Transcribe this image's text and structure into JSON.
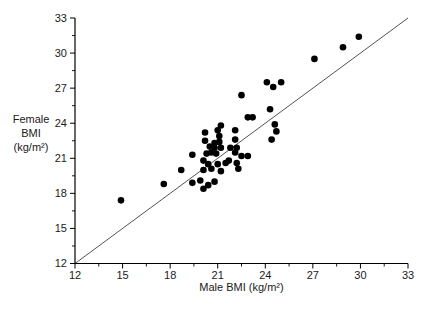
{
  "chart_data": {
    "type": "scatter",
    "title": "",
    "xlabel": "Male BMI (kg/m²)",
    "ylabel_lines": [
      "Female",
      "BMI",
      "(kg/m²)"
    ],
    "xlim": [
      12,
      33
    ],
    "ylim": [
      12,
      33
    ],
    "x_ticks": [
      12,
      15,
      18,
      21,
      24,
      27,
      30,
      33
    ],
    "y_ticks": [
      12,
      15,
      18,
      21,
      24,
      27,
      30,
      33
    ],
    "minor_tick_interval": 1.5,
    "grid": false,
    "legend": "none",
    "identity_line": {
      "from": [
        12,
        12
      ],
      "to": [
        33,
        33
      ]
    },
    "colors": {
      "marker": "#000000",
      "axis": "#000000",
      "identity_line": "#3f3f3f",
      "text": "#1a1a1a"
    },
    "marker": {
      "shape": "circle",
      "radius_px": 3.3
    },
    "points": [
      [
        29.9,
        31.4
      ],
      [
        28.9,
        30.5
      ],
      [
        27.1,
        29.5
      ],
      [
        24.1,
        27.5
      ],
      [
        24.5,
        27.1
      ],
      [
        25.0,
        27.5
      ],
      [
        22.5,
        26.4
      ],
      [
        24.3,
        25.2
      ],
      [
        22.9,
        24.5
      ],
      [
        23.2,
        24.5
      ],
      [
        24.6,
        23.9
      ],
      [
        24.7,
        23.3
      ],
      [
        24.4,
        22.6
      ],
      [
        21.2,
        23.8
      ],
      [
        20.2,
        23.2
      ],
      [
        21.0,
        23.4
      ],
      [
        22.1,
        23.4
      ],
      [
        21.1,
        22.9
      ],
      [
        22.1,
        22.6
      ],
      [
        20.2,
        22.5
      ],
      [
        20.8,
        22.3
      ],
      [
        21.1,
        22.4
      ],
      [
        20.5,
        22.0
      ],
      [
        20.8,
        21.9
      ],
      [
        21.2,
        21.9
      ],
      [
        21.8,
        21.9
      ],
      [
        22.2,
        21.9
      ],
      [
        19.4,
        21.3
      ],
      [
        20.3,
        21.4
      ],
      [
        20.6,
        21.5
      ],
      [
        20.9,
        21.4
      ],
      [
        22.1,
        21.5
      ],
      [
        22.5,
        21.2
      ],
      [
        22.9,
        21.2
      ],
      [
        20.1,
        20.8
      ],
      [
        20.4,
        20.5
      ],
      [
        21.0,
        20.5
      ],
      [
        21.5,
        20.6
      ],
      [
        21.7,
        20.8
      ],
      [
        22.2,
        20.6
      ],
      [
        18.7,
        20.0
      ],
      [
        20.1,
        20.0
      ],
      [
        20.6,
        20.1
      ],
      [
        21.2,
        19.9
      ],
      [
        22.3,
        20.1
      ],
      [
        19.4,
        18.9
      ],
      [
        19.9,
        19.1
      ],
      [
        20.8,
        19.0
      ],
      [
        20.4,
        18.7
      ],
      [
        20.1,
        18.4
      ],
      [
        17.6,
        18.8
      ],
      [
        14.9,
        17.4
      ]
    ]
  }
}
